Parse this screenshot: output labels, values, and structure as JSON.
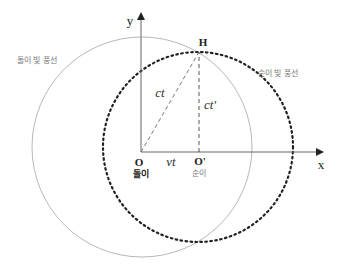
{
  "diagram": {
    "axes": {
      "x_label": "x",
      "y_label": "y"
    },
    "points": {
      "origin": {
        "label": "O",
        "caption": "돌이"
      },
      "moving_origin": {
        "label": "O'",
        "caption": "순이"
      },
      "top_point": {
        "label": "H"
      }
    },
    "segments": {
      "hypotenuse": "ct",
      "vertical": "ct'",
      "baseline": "vt"
    },
    "circles": {
      "stationary": {
        "label": "돌이 빛 풍선",
        "style": "thin-gray",
        "color": "#b0b0b0"
      },
      "moving": {
        "label": "순이 빛 풍선",
        "style": "bold-dotted",
        "color": "#222222"
      }
    }
  }
}
